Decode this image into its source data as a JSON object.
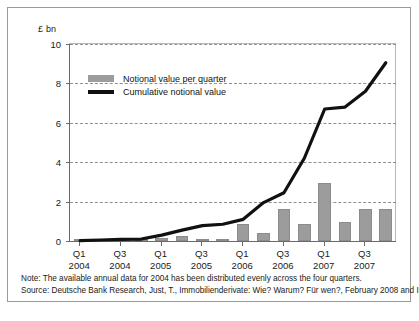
{
  "figure": {
    "unit_label": "£ bn",
    "note": "Note: The available annual data for 2004 has been distributed evenly across the four quarters.",
    "source": "Source: Deutsche Bank Research, Just, T., Immobilienderivate: Wie? Warum? Für wen?, February 2008 and IPD"
  },
  "colors": {
    "bar": "#9c9c9c",
    "line": "#111111",
    "grid": "#8f8f8f",
    "axis": "#6a6a6a",
    "frame": "#9a9a9a",
    "text": "#1a1a1a"
  },
  "chart_data": {
    "type": "bar",
    "title": "",
    "subtitle": "",
    "xlabel": "",
    "ylabel": "£ bn",
    "ylim": [
      0,
      10
    ],
    "yticks": [
      0,
      2,
      4,
      6,
      8,
      10
    ],
    "ytick_labels": [
      "0",
      "2",
      "4",
      "6",
      "8",
      "10"
    ],
    "grid": true,
    "legend_position": "top-left",
    "categories": [
      "Q1 2004",
      "Q2 2004",
      "Q3 2004",
      "Q4 2004",
      "Q1 2005",
      "Q2 2005",
      "Q3 2005",
      "Q4 2005",
      "Q1 2006",
      "Q2 2006",
      "Q3 2006",
      "Q4 2006",
      "Q1 2007",
      "Q2 2007",
      "Q3 2007",
      "Q4 2007"
    ],
    "xtick_labels": [
      {
        "quarter": "Q1",
        "year": "2004",
        "index": 0
      },
      {
        "quarter": "Q3",
        "year": "2004",
        "index": 2
      },
      {
        "quarter": "Q1",
        "year": "2005",
        "index": 4
      },
      {
        "quarter": "Q3",
        "year": "2005",
        "index": 6
      },
      {
        "quarter": "Q1",
        "year": "2006",
        "index": 8
      },
      {
        "quarter": "Q3",
        "year": "2006",
        "index": 10
      },
      {
        "quarter": "Q1",
        "year": "2007",
        "index": 12
      },
      {
        "quarter": "Q3",
        "year": "2007",
        "index": 14
      }
    ],
    "series": [
      {
        "name": "Notional value per quarter",
        "type": "bar",
        "color": "#9c9c9c",
        "values": [
          0.02,
          0.02,
          0.02,
          0.02,
          0.15,
          0.25,
          0.02,
          0.1,
          0.85,
          0.42,
          1.62,
          0.85,
          2.92,
          0.97,
          1.62,
          1.62
        ]
      },
      {
        "name": "Cumulative notional value",
        "type": "line",
        "color": "#111111",
        "values": [
          0.02,
          0.05,
          0.08,
          0.1,
          0.3,
          0.55,
          0.78,
          0.85,
          1.1,
          1.95,
          2.45,
          4.2,
          6.7,
          6.8,
          7.6,
          9.05
        ]
      }
    ]
  }
}
